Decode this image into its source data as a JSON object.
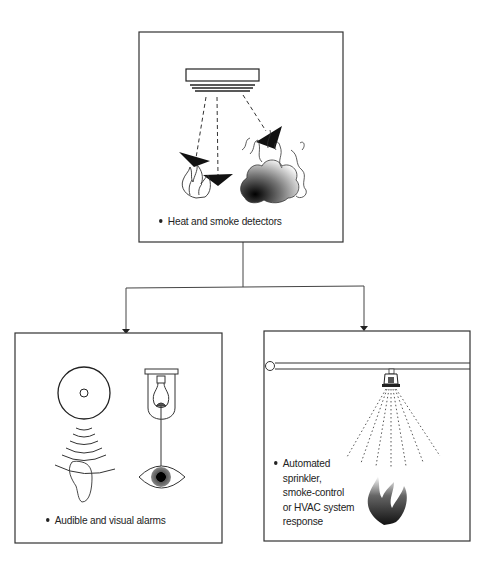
{
  "diagram": {
    "type": "flowchart",
    "nodes": [
      {
        "id": "detectors",
        "label": "Heat and smoke detectors",
        "icons": [
          "smoke-detector-icon",
          "flame-icon",
          "smoke-cloud-icon"
        ]
      },
      {
        "id": "alarms",
        "label": "Audible and visual alarms",
        "icons": [
          "siren-speaker-icon",
          "sound-waves-icon",
          "ear-icon",
          "strobe-lamp-icon",
          "eye-icon"
        ]
      },
      {
        "id": "response",
        "label_lines": [
          "Automated",
          "sprinkler,",
          "smoke-control",
          "or HVAC system",
          "response"
        ],
        "icons": [
          "sprinkler-pipe-icon",
          "sprinkler-head-icon",
          "water-spray-icon",
          "flame-icon"
        ]
      }
    ],
    "edges": [
      {
        "from": "detectors",
        "to": "alarms"
      },
      {
        "from": "detectors",
        "to": "response"
      }
    ]
  },
  "labels": {
    "detectors": "Heat and smoke detectors",
    "alarms": "Audible and visual alarms",
    "response_1": "Automated",
    "response_2": "sprinkler,",
    "response_3": "smoke-control",
    "response_4": "or HVAC system",
    "response_5": "response"
  },
  "colors": {
    "line": "#333333",
    "background": "#ffffff",
    "text": "#222222"
  }
}
